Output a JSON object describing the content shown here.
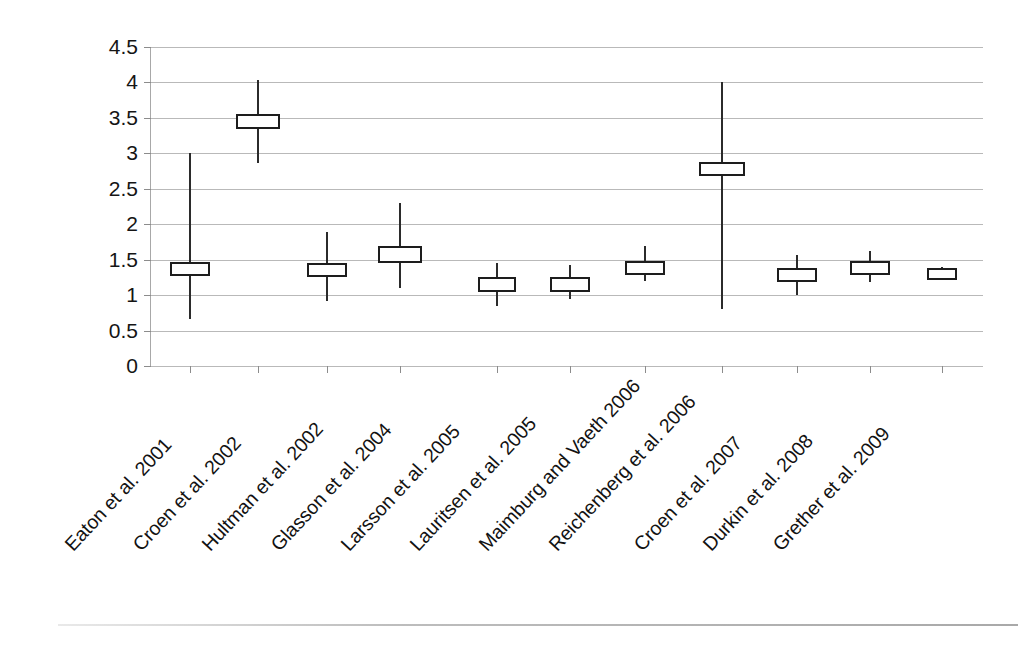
{
  "chart_data": {
    "type": "bar",
    "title": "",
    "subtitle": "",
    "xlabel": "",
    "ylabel": "Relative risk",
    "ylim": [
      0,
      4.5
    ],
    "grid": true,
    "legend": "none",
    "y_ticks": [
      "0",
      "0.5",
      "1",
      "1.5",
      "2",
      "2.5",
      "3",
      "3.5",
      "4",
      "4.5"
    ],
    "y_tick_values": [
      0,
      0.5,
      1,
      1.5,
      2,
      2.5,
      3,
      3.5,
      4,
      4.5
    ],
    "categories": [
      "Eaton et al. 2001",
      "Croen et al. 2002",
      "Hultman et al. 2002",
      "Glasson et al. 2004",
      "Larsson et al. 2005",
      "Lauritsen et al. 2005",
      "Maimburg and Vaeth 2006",
      "Reichenberg et al. 2006",
      "Croen et al. 2007",
      "Durkin et al. 2008",
      "Grether et al. 2009"
    ],
    "series": [
      {
        "name": "Relative risk estimate",
        "values": [
          1.37,
          3.45,
          1.35,
          1.57,
          1.15,
          1.15,
          1.38,
          2.78,
          1.28,
          1.38,
          1.3
        ]
      },
      {
        "name": "Lower confidence limit",
        "values": [
          0.66,
          2.86,
          0.92,
          1.1,
          0.84,
          0.94,
          1.2,
          0.8,
          1.0,
          1.18,
          1.21
        ]
      },
      {
        "name": "Upper confidence limit",
        "values": [
          3.0,
          4.04,
          1.89,
          2.3,
          1.46,
          1.42,
          1.69,
          4.0,
          1.57,
          1.62,
          1.4
        ]
      }
    ],
    "box_half_heights": [
      0.1,
      0.1,
      0.1,
      0.12,
      0.1,
      0.1,
      0.1,
      0.1,
      0.1,
      0.1,
      0.08
    ],
    "box_widths_px": [
      40,
      44,
      40,
      44,
      38,
      40,
      40,
      46,
      40,
      40,
      30
    ]
  }
}
